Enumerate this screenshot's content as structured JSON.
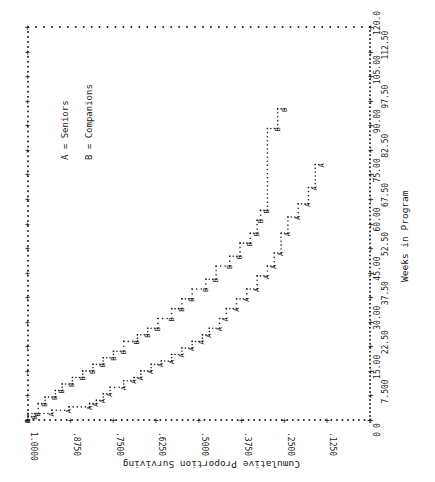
{
  "chart_data": {
    "type": "line",
    "step": true,
    "title": "",
    "xlabel": "Weeks in Program",
    "ylabel": "Cumulative Proportion Surviving",
    "xlim": [
      0,
      120
    ],
    "ylim": [
      0,
      1
    ],
    "x_ticks": [
      "0",
      "7.500",
      "15.00",
      "22.50",
      "30.00",
      "37.50",
      "45.00",
      "52.50",
      "60.00",
      "67.50",
      "75.00",
      "82.50",
      "90.00",
      "97.50",
      "105.00",
      "112.50",
      "120.0"
    ],
    "y_ticks": [
      "0",
      ".1250",
      ".2500",
      ".3750",
      ".5000",
      ".6250",
      ".7500",
      ".8750",
      "1.0000"
    ],
    "legend": [
      {
        "marker": "A",
        "label": "A = Seniors"
      },
      {
        "marker": "B",
        "label": "B = Companions"
      }
    ],
    "orientation": "rotated 90 degrees counter-clockwise",
    "series": [
      {
        "name": "Seniors",
        "marker": "A",
        "points": [
          [
            0,
            1.0
          ],
          [
            2,
            0.93
          ],
          [
            3,
            0.88
          ],
          [
            4,
            0.82
          ],
          [
            5,
            0.8
          ],
          [
            6,
            0.78
          ],
          [
            8,
            0.76
          ],
          [
            10,
            0.72
          ],
          [
            12,
            0.69
          ],
          [
            13,
            0.67
          ],
          [
            15,
            0.64
          ],
          [
            17,
            0.61
          ],
          [
            18,
            0.58
          ],
          [
            20,
            0.55
          ],
          [
            22,
            0.52
          ],
          [
            24,
            0.49
          ],
          [
            26,
            0.47
          ],
          [
            28,
            0.44
          ],
          [
            31,
            0.42
          ],
          [
            34,
            0.39
          ],
          [
            37,
            0.36
          ],
          [
            40,
            0.33
          ],
          [
            44,
            0.3
          ],
          [
            47,
            0.28
          ],
          [
            51,
            0.26
          ],
          [
            57,
            0.24
          ],
          [
            62,
            0.21
          ],
          [
            66,
            0.18
          ],
          [
            71,
            0.16
          ],
          [
            78,
            0.14
          ]
        ]
      },
      {
        "name": "Companions",
        "marker": "B",
        "points": [
          [
            0,
            1.0
          ],
          [
            1,
            0.98
          ],
          [
            2,
            0.97
          ],
          [
            5,
            0.95
          ],
          [
            7,
            0.92
          ],
          [
            9,
            0.9
          ],
          [
            11,
            0.87
          ],
          [
            13,
            0.84
          ],
          [
            15,
            0.81
          ],
          [
            17,
            0.78
          ],
          [
            19,
            0.75
          ],
          [
            21,
            0.72
          ],
          [
            24,
            0.68
          ],
          [
            26,
            0.65
          ],
          [
            28,
            0.62
          ],
          [
            31,
            0.58
          ],
          [
            34,
            0.55
          ],
          [
            37,
            0.52
          ],
          [
            40,
            0.48
          ],
          [
            43,
            0.45
          ],
          [
            47,
            0.41
          ],
          [
            50,
            0.38
          ],
          [
            54,
            0.35
          ],
          [
            57,
            0.33
          ],
          [
            61,
            0.32
          ],
          [
            64,
            0.3
          ],
          [
            89,
            0.27
          ],
          [
            95,
            0.25
          ]
        ]
      }
    ]
  }
}
